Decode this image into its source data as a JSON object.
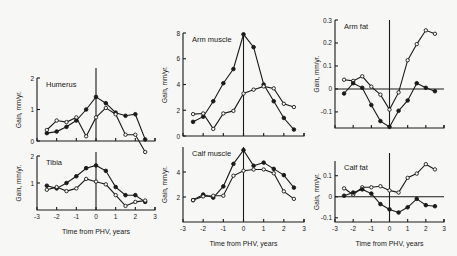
{
  "figure": {
    "xlabel": "Time from PHV, years",
    "ylabel": "Gain, mm/yr."
  },
  "chart_data": [
    {
      "type": "line",
      "title": "Humerus",
      "xlabel": "",
      "ylabel": "Gain, mm/yr.",
      "xlim": [
        -3,
        3
      ],
      "ylim": [
        0,
        2
      ],
      "yticks": [
        0,
        1,
        2
      ],
      "ytick_labels": [
        "0",
        "1",
        "2"
      ],
      "xticks": [
        -3,
        -2,
        -1,
        0,
        1,
        2,
        3
      ],
      "xtick_labels": [],
      "vline_x": 0,
      "series": [
        {
          "name": "filled",
          "marker": "filled",
          "x": [
            -2.5,
            -2,
            -1.5,
            -1,
            -0.5,
            0,
            0.5,
            1,
            1.5,
            2,
            2.5
          ],
          "values": [
            0.25,
            0.3,
            0.45,
            0.65,
            1.0,
            1.4,
            1.2,
            0.9,
            0.8,
            0.85,
            0.05
          ]
        },
        {
          "name": "open",
          "marker": "open",
          "x": [
            -2.5,
            -2,
            -1.5,
            -1,
            -0.5,
            0,
            0.5,
            1,
            1.5,
            2,
            2.5
          ],
          "values": [
            0.35,
            0.65,
            0.6,
            0.75,
            0.15,
            0.75,
            1.05,
            0.85,
            0.2,
            0.2,
            -0.35
          ]
        }
      ]
    },
    {
      "type": "line",
      "title": "Tibia",
      "xlabel": "Time from PHV, years",
      "ylabel": "Gain, mm/yr.",
      "xlim": [
        -3,
        3
      ],
      "ylim": [
        0,
        2
      ],
      "yticks": [
        1,
        2
      ],
      "ytick_labels": [
        "1",
        "2"
      ],
      "xticks": [
        -3,
        -2,
        -1,
        0,
        1,
        2,
        3
      ],
      "xtick_labels": [
        "-3",
        "-2",
        "-1",
        "0",
        "1",
        "2",
        "3"
      ],
      "vline_x": 0,
      "series": [
        {
          "name": "filled",
          "marker": "filled",
          "x": [
            -2.5,
            -2,
            -1.5,
            -1,
            -0.5,
            0,
            0.5,
            1,
            1.5,
            2,
            2.5
          ],
          "values": [
            0.9,
            0.8,
            1.0,
            1.25,
            1.55,
            1.65,
            1.45,
            0.85,
            0.55,
            0.55,
            0.3
          ]
        },
        {
          "name": "open",
          "marker": "open",
          "x": [
            -2.5,
            -2,
            -1.5,
            -1,
            -0.5,
            0,
            0.5,
            1,
            1.5,
            2,
            2.5
          ],
          "values": [
            0.75,
            0.85,
            0.7,
            0.8,
            1.15,
            1.05,
            0.95,
            0.55,
            0.15,
            0.3,
            0.35
          ]
        }
      ]
    },
    {
      "type": "line",
      "title": "Arm muscle",
      "xlabel": "",
      "ylabel": "Gain, mm/yr.",
      "xlim": [
        -3,
        3
      ],
      "ylim": [
        0,
        8
      ],
      "yticks": [
        0,
        2,
        4,
        6,
        8
      ],
      "ytick_labels": [
        "0",
        "2",
        "4",
        "6",
        "8"
      ],
      "xticks": [
        -3,
        -2,
        -1,
        0,
        1,
        2,
        3
      ],
      "xtick_labels": [],
      "vline_x": 0,
      "series": [
        {
          "name": "filled",
          "marker": "filled",
          "x": [
            -2.5,
            -2,
            -1.5,
            -1,
            -0.5,
            0,
            0.5,
            1,
            1.5,
            2,
            2.5
          ],
          "values": [
            1.1,
            1.5,
            2.7,
            4.1,
            5.2,
            7.9,
            6.9,
            4.0,
            2.7,
            1.4,
            0.5
          ]
        },
        {
          "name": "open",
          "marker": "open",
          "x": [
            -2.5,
            -2,
            -1.5,
            -1,
            -0.5,
            0,
            0.5,
            1,
            1.5,
            2,
            2.5
          ],
          "values": [
            1.7,
            1.75,
            0.55,
            1.75,
            1.95,
            3.3,
            3.6,
            3.85,
            3.7,
            2.5,
            2.25
          ]
        }
      ]
    },
    {
      "type": "line",
      "title": "Calf muscle",
      "xlabel": "Time from PHV, years",
      "ylabel": "Gain, mm/yr.",
      "xlim": [
        -3,
        3
      ],
      "ylim": [
        0,
        6
      ],
      "yticks": [
        2,
        4
      ],
      "ytick_labels": [
        "2",
        "4"
      ],
      "xticks": [
        -3,
        -2,
        -1,
        0,
        1,
        2,
        3
      ],
      "xtick_labels": [
        "-3",
        "-2",
        "-1",
        "0",
        "1",
        "2",
        "3"
      ],
      "vline_x": 0,
      "series": [
        {
          "name": "filled",
          "marker": "filled",
          "x": [
            -2.5,
            -2,
            -1.5,
            -1,
            -0.5,
            0,
            0.5,
            1,
            1.5,
            2,
            2.5
          ],
          "values": [
            1.75,
            2.2,
            1.95,
            2.85,
            4.65,
            5.75,
            4.5,
            4.75,
            4.25,
            3.75,
            2.75
          ]
        },
        {
          "name": "open",
          "marker": "open",
          "x": [
            -2.5,
            -2,
            -1.5,
            -1,
            -0.5,
            0,
            0.5,
            1,
            1.5,
            2,
            2.5
          ],
          "values": [
            1.75,
            2.05,
            2.1,
            2.1,
            3.7,
            4.1,
            4.2,
            4.2,
            3.9,
            2.45,
            1.85
          ]
        }
      ]
    },
    {
      "type": "line",
      "title": "Arm fat",
      "xlabel": "",
      "ylabel": "Gain, mm/yr.",
      "xlim": [
        -3,
        3
      ],
      "ylim": [
        -0.17,
        0.3
      ],
      "yticks": [
        -0.1,
        0,
        0.1,
        0.2,
        0.3
      ],
      "ytick_labels": [
        "-0.1",
        "0",
        "0.1",
        "0.2",
        "0.3"
      ],
      "xticks": [
        -3,
        -2,
        -1,
        0,
        1,
        2,
        3
      ],
      "xtick_labels": [],
      "vline_x": 0,
      "hline_y": 0,
      "series": [
        {
          "name": "open",
          "marker": "open",
          "x": [
            -2.5,
            -2,
            -1.5,
            -1,
            -0.5,
            0,
            0.5,
            1,
            1.5,
            2,
            2.5
          ],
          "values": [
            0.04,
            0.035,
            0.055,
            0.01,
            -0.025,
            -0.09,
            -0.015,
            0.125,
            0.195,
            0.255,
            0.24
          ]
        },
        {
          "name": "filled",
          "marker": "filled",
          "x": [
            -2.5,
            -2,
            -1.5,
            -1,
            -0.5,
            0,
            0.5,
            1,
            1.5,
            2,
            2.5
          ],
          "values": [
            -0.02,
            0.025,
            0.005,
            -0.07,
            -0.14,
            -0.165,
            -0.095,
            -0.05,
            0.025,
            0.005,
            -0.01
          ]
        }
      ]
    },
    {
      "type": "line",
      "title": "Calf fat",
      "xlabel": "Time from PHV, years",
      "ylabel": "Gain, mm/yr.",
      "xlim": [
        -3,
        3
      ],
      "ylim": [
        -0.12,
        0.17
      ],
      "yticks": [
        -0.1,
        0,
        0.1
      ],
      "ytick_labels": [
        "-0.1",
        "0",
        "0.1"
      ],
      "xticks": [
        -3,
        -2,
        -1,
        0,
        1,
        2,
        3
      ],
      "xtick_labels": [
        "-3",
        "-2",
        "-1",
        "0",
        "1",
        "2",
        "3"
      ],
      "vline_x": 0,
      "hline_y": 0,
      "series": [
        {
          "name": "open",
          "marker": "open",
          "x": [
            -2.5,
            -2,
            -1.5,
            -1,
            -0.5,
            0,
            0.5,
            1,
            1.5,
            2,
            2.5
          ],
          "values": [
            0.04,
            0.01,
            0.045,
            0.045,
            0.05,
            0.03,
            0.02,
            0.09,
            0.11,
            0.155,
            0.13
          ]
        },
        {
          "name": "filled",
          "marker": "filled",
          "x": [
            -2.5,
            -2,
            -1.5,
            -1,
            -0.5,
            0,
            0.5,
            1,
            1.5,
            2,
            2.5
          ],
          "values": [
            0.005,
            0.02,
            0.035,
            0.015,
            -0.035,
            -0.06,
            -0.075,
            -0.05,
            -0.01,
            -0.04,
            -0.045
          ]
        }
      ]
    }
  ]
}
